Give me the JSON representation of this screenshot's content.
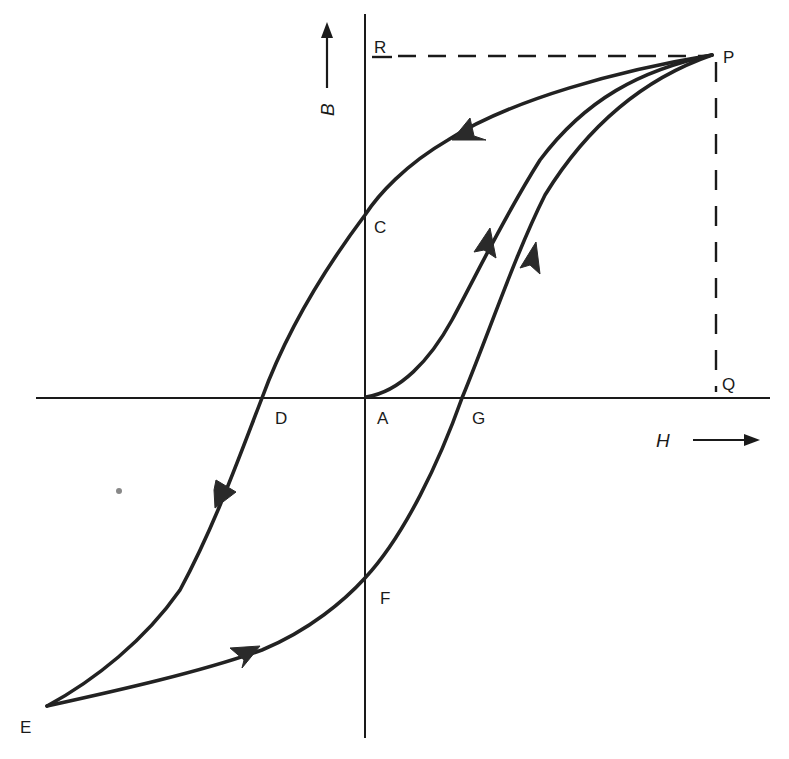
{
  "axes": {
    "vertical": {
      "label": "B",
      "x": 365,
      "y1": 14,
      "y2": 738
    },
    "horizontal": {
      "label": "H",
      "y": 398,
      "x1": 36,
      "x2": 770
    }
  },
  "points": {
    "P": {
      "label": "P",
      "x": 712,
      "y": 55
    },
    "R": {
      "label": "R",
      "x": 365,
      "y": 55
    },
    "Q": {
      "label": "Q",
      "x": 712,
      "y": 398
    },
    "C": {
      "label": "C",
      "x": 365,
      "y": 215
    },
    "D": {
      "label": "D",
      "x": 262,
      "y": 398
    },
    "A": {
      "label": "A",
      "x": 365,
      "y": 398
    },
    "G": {
      "label": "G",
      "x": 462,
      "y": 398
    },
    "F": {
      "label": "F",
      "x": 365,
      "y": 578
    },
    "E": {
      "label": "E",
      "x": 47,
      "y": 706
    }
  },
  "labels": {
    "P": "P",
    "R": "R",
    "Q": "Q",
    "C": "C",
    "D": "D",
    "A": "A",
    "G": "G",
    "F": "F",
    "E": "E",
    "B_axis": "B",
    "H_axis": "H"
  },
  "curves": [
    {
      "name": "initial-magnetization",
      "from": "A",
      "to": "P",
      "description": "Virgin curve from origin A up to saturation P"
    },
    {
      "name": "upper-branch",
      "from": "P",
      "to": "E",
      "via": [
        "C",
        "D"
      ],
      "description": "Decreasing H: P → C (remanence) → D (coercivity) → E (negative saturation)"
    },
    {
      "name": "lower-branch",
      "from": "E",
      "to": "P",
      "via": [
        "F",
        "G"
      ],
      "description": "Increasing H: E → F → G → P"
    }
  ],
  "guides": [
    {
      "name": "dashed-PR",
      "from": "P",
      "to": "R"
    },
    {
      "name": "dashed-PQ",
      "from": "P",
      "to": "Q"
    }
  ],
  "colors": {
    "ink": "#1a1a1a",
    "curve": "#222222",
    "background": "#ffffff"
  }
}
